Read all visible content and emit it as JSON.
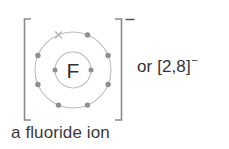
{
  "background_color": "#ffffff",
  "diagram": {
    "kind": "bohr-shell-diagram",
    "element_symbol": "F",
    "element_name": "fluorine",
    "species": "fluoride ion",
    "overall_charge": "−",
    "bracket": {
      "left": "[",
      "right": "]",
      "charge_superscript": "−"
    },
    "shells": [
      {
        "index": 1,
        "name": "inner-shell",
        "electron_count": 2,
        "radius": 18,
        "electron_angles": [
          180,
          0
        ],
        "marked_electron_indices": []
      },
      {
        "index": 2,
        "name": "outer-shell",
        "electron_count": 8,
        "radius": 38,
        "electron_angles": [
          247.5,
          292.5,
          337.5,
          22.5,
          67.5,
          112.5,
          157.5,
          202.5
        ],
        "marked_electron_indices": [
          0
        ]
      }
    ],
    "electron_configuration": "2,8",
    "colors": {
      "shell_stroke": "#b9b9b9",
      "electron_fill": "#8f8f93",
      "cross_marker": "#b0b0b0",
      "bracket_stroke": "#8a8a8a",
      "symbol_text": "#333333"
    },
    "center": {
      "x": 73,
      "y": 70
    }
  },
  "alt_notation": {
    "prefix": "or",
    "bracket_open": "[",
    "configuration": "2,8",
    "bracket_close": "]",
    "charge": "−",
    "full_text": "or [2,8]−"
  },
  "caption": {
    "text": "a fluoride ion"
  },
  "icons": {
    "cross_marker": "cross-electron-marker",
    "electron_dot": "electron-dot"
  }
}
